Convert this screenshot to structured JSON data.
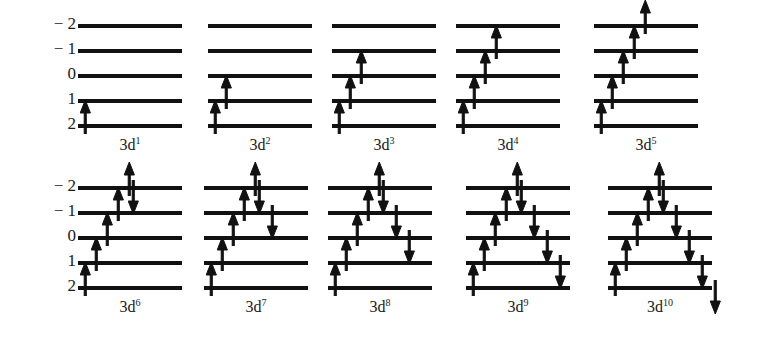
{
  "figure": {
    "background_color": "#ffffff",
    "line_color": "#111111",
    "text_color": "#1a1a1a",
    "axis_labels": [
      "− 2",
      "− 1",
      "0",
      "1",
      "2"
    ],
    "m_values": [
      -2,
      -1,
      0,
      1,
      2
    ],
    "level_count": 5
  },
  "rows": [
    {
      "axis_labels": [
        "− 2",
        "− 1",
        "0",
        "1",
        "2"
      ],
      "panels": [
        {
          "caption_base": "3d",
          "caption_sup": "1",
          "caption": "3d1",
          "electron_count": 1,
          "up_spins": [
            2
          ],
          "down_spins": []
        },
        {
          "caption_base": "3d",
          "caption_sup": "2",
          "caption": "3d2",
          "electron_count": 2,
          "up_spins": [
            2,
            1
          ],
          "down_spins": []
        },
        {
          "caption_base": "3d",
          "caption_sup": "3",
          "caption": "3d3",
          "electron_count": 3,
          "up_spins": [
            2,
            1,
            0
          ],
          "down_spins": []
        },
        {
          "caption_base": "3d",
          "caption_sup": "4",
          "caption": "3d4",
          "electron_count": 4,
          "up_spins": [
            2,
            1,
            0,
            -1
          ],
          "down_spins": []
        },
        {
          "caption_base": "3d",
          "caption_sup": "5",
          "caption": "3d5",
          "electron_count": 5,
          "up_spins": [
            2,
            1,
            0,
            -1,
            -2
          ],
          "down_spins": []
        }
      ]
    },
    {
      "axis_labels": [
        "− 2",
        "− 1",
        "0",
        "1",
        "2"
      ],
      "panels": [
        {
          "caption_base": "3d",
          "caption_sup": "6",
          "caption": "3d6",
          "electron_count": 6,
          "up_spins": [
            2,
            1,
            0,
            -1,
            -2
          ],
          "down_spins": [
            -2
          ]
        },
        {
          "caption_base": "3d",
          "caption_sup": "7",
          "caption": "3d7",
          "electron_count": 7,
          "up_spins": [
            2,
            1,
            0,
            -1,
            -2
          ],
          "down_spins": [
            -2,
            -1
          ]
        },
        {
          "caption_base": "3d",
          "caption_sup": "8",
          "caption": "3d8",
          "electron_count": 8,
          "up_spins": [
            2,
            1,
            0,
            -1,
            -2
          ],
          "down_spins": [
            -2,
            -1,
            0
          ]
        },
        {
          "caption_base": "3d",
          "caption_sup": "9",
          "caption": "3d9",
          "electron_count": 9,
          "up_spins": [
            2,
            1,
            0,
            -1,
            -2
          ],
          "down_spins": [
            -2,
            -1,
            0,
            1
          ]
        },
        {
          "caption_base": "3d",
          "caption_sup": "10",
          "caption": "3d10",
          "electron_count": 10,
          "up_spins": [
            2,
            1,
            0,
            -1,
            -2
          ],
          "down_spins": [
            -2,
            -1,
            0,
            1,
            2
          ]
        }
      ]
    }
  ],
  "layout": {
    "row_tops": [
      8,
      170
    ],
    "panel_lefts": [
      78,
      208,
      332,
      456,
      594
    ],
    "panel_lefts_bottom": [
      78,
      204,
      328,
      466,
      608
    ],
    "level_spacing": 25,
    "level_width": 104
  }
}
